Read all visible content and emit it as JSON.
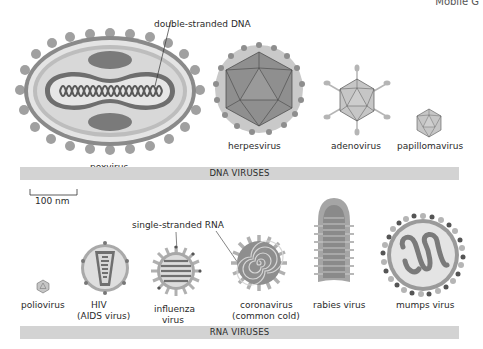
{
  "page": {
    "header_fragment": "Mobile G"
  },
  "colors": {
    "dark_gray": "#6e6e6e",
    "mid_gray": "#9a9a9a",
    "light_gray": "#c4c4c4",
    "pale_gray": "#e2e2e2",
    "band": "#d3d3d3"
  },
  "dna_section": {
    "band_label": "DNA VIRUSES",
    "annotation": "double-stranded DNA",
    "viruses": [
      {
        "name": "poxvirus"
      },
      {
        "name": "herpesvirus"
      },
      {
        "name": "adenovirus"
      },
      {
        "name": "papillomavirus"
      }
    ]
  },
  "scale_bar": {
    "label": "100 nm"
  },
  "rna_section": {
    "band_label": "RNA VIRUSES",
    "annotation": "single-stranded RNA",
    "viruses": [
      {
        "name": "poliovirus",
        "line2": ""
      },
      {
        "name": "HIV",
        "line2": "(AIDS virus)"
      },
      {
        "name": "influenza",
        "line2": "virus"
      },
      {
        "name": "coronavirus",
        "line2": "(common cold)"
      },
      {
        "name": "rabies virus",
        "line2": ""
      },
      {
        "name": "mumps virus",
        "line2": ""
      }
    ]
  }
}
